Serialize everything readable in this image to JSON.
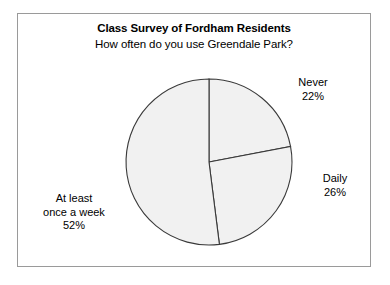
{
  "chart_data": {
    "type": "pie",
    "title": "Class Survey of Fordham Residents",
    "subtitle": "How often do you use Greendale Park?",
    "xlabel": "",
    "ylabel": "",
    "legend_position": "outside-labels",
    "grid": false,
    "categories": [
      "Never",
      "Daily",
      "At least once a week"
    ],
    "values": [
      22,
      26,
      52
    ],
    "units": "%",
    "slices": [
      {
        "label": "Never",
        "value": 22,
        "value_text": "22%",
        "start_angle_deg": 0,
        "end_angle_deg": 79.2,
        "fill": "#f1f1f1",
        "stroke": "#3a3a3a"
      },
      {
        "label": "Daily",
        "value": 26,
        "value_text": "26%",
        "start_angle_deg": 79.2,
        "end_angle_deg": 172.8,
        "fill": "#f1f1f1",
        "stroke": "#3a3a3a"
      },
      {
        "label": "At least once a week",
        "value": 52,
        "value_text": "52%",
        "label_line1": "At least",
        "label_line2": "once a week",
        "start_angle_deg": 172.8,
        "end_angle_deg": 360,
        "fill": "#f1f1f1",
        "stroke": "#3a3a3a"
      }
    ]
  },
  "frame": {
    "border_color": "#9a9a9a"
  }
}
